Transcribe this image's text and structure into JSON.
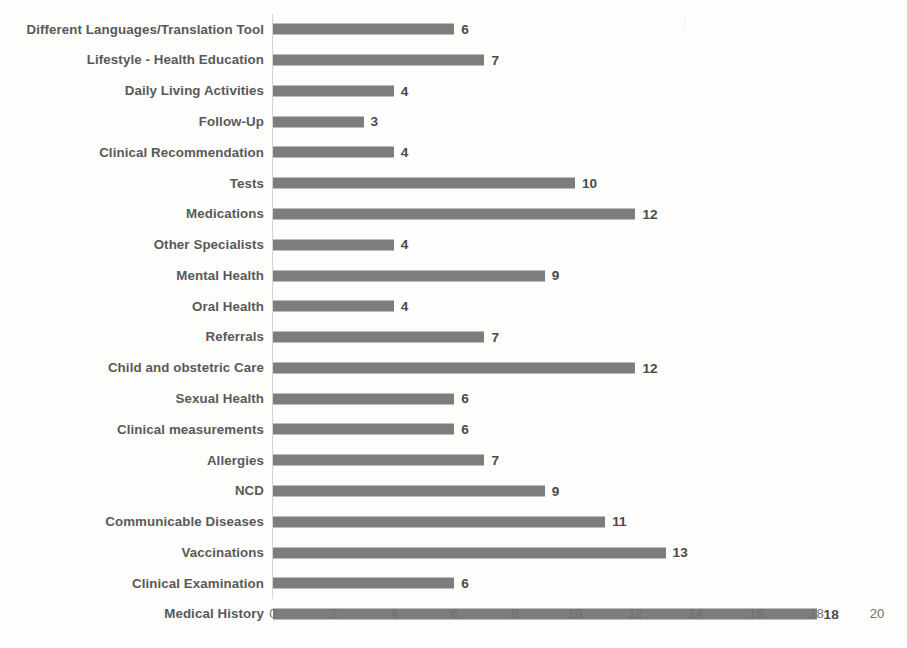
{
  "chart_data": {
    "type": "bar",
    "orientation": "horizontal",
    "title": "",
    "xlabel": "",
    "ylabel": "",
    "xlim": [
      0,
      20
    ],
    "xticks": [
      0,
      2,
      4,
      6,
      8,
      10,
      12,
      14,
      16,
      18,
      20
    ],
    "grid": false,
    "legend": false,
    "bar_color": "#7d7d7d",
    "label_color": "#59595a",
    "value_label_color": "#4a4a4a",
    "axis_color": "#d6d6d6",
    "background": "#fdfdfc",
    "categories": [
      "Different Languages/Translation Tool",
      "Lifestyle - Health Education",
      "Daily Living Activities",
      "Follow-Up",
      "Clinical Recommendation",
      "Tests",
      "Medications",
      "Other Specialists",
      "Mental Health",
      "Oral Health",
      "Referrals",
      "Child and obstetric Care",
      "Sexual Health",
      "Clinical measurements",
      "Allergies",
      "NCD",
      "Communicable Diseases",
      "Vaccinations",
      "Clinical Examination",
      "Medical History"
    ],
    "values": [
      6,
      7,
      4,
      3,
      4,
      10,
      12,
      4,
      9,
      4,
      7,
      12,
      6,
      6,
      7,
      9,
      11,
      13,
      6,
      18
    ],
    "value_labels": [
      "6",
      "7",
      "4",
      "3",
      "4",
      "10",
      "12",
      "4",
      "9",
      "4",
      "7",
      "12",
      "6",
      "6",
      "7",
      "9",
      "11",
      "13",
      "6",
      "18"
    ],
    "tick_labels": [
      "0",
      "2",
      "4",
      "6",
      "8",
      "10",
      "12",
      "14",
      "16",
      "18",
      "20"
    ]
  }
}
